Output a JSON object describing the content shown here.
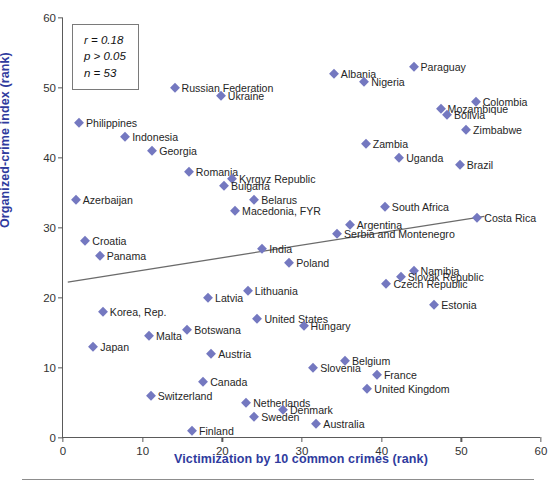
{
  "chart_data": {
    "type": "scatter",
    "title": "",
    "xlabel": "Victimization by 10 common crimes (rank)",
    "ylabel": "Organized-crime index (rank)",
    "xlim": [
      0,
      60
    ],
    "ylim": [
      0,
      60
    ],
    "xticks": [
      0,
      10,
      20,
      30,
      40,
      50,
      60
    ],
    "yticks": [
      0,
      10,
      20,
      30,
      40,
      50,
      60
    ],
    "grid": false,
    "legend": "none",
    "marker_color": "#7478c0",
    "marker_shape": "diamond",
    "annotations": {
      "r": "r = 0.18",
      "p": "p > 0.05",
      "n": "n = 53"
    },
    "trendline": {
      "type": "linear",
      "x0": 0.6,
      "y0": 22.2,
      "x1": 53.0,
      "y1": 31.6
    },
    "points": [
      {
        "label": "Paraguay",
        "x": 44.0,
        "y": 53.0,
        "side": "right"
      },
      {
        "label": "Albania",
        "x": 34.0,
        "y": 52.0,
        "side": "right"
      },
      {
        "label": "Nigeria",
        "x": 37.8,
        "y": 50.8,
        "side": "right"
      },
      {
        "label": "Russian Federation",
        "x": 14.0,
        "y": 50.0,
        "side": "right"
      },
      {
        "label": "Ukraine",
        "x": 19.8,
        "y": 48.8,
        "side": "right"
      },
      {
        "label": "Colombia",
        "x": 51.8,
        "y": 48.0,
        "side": "right"
      },
      {
        "label": "Mozambique",
        "x": 47.4,
        "y": 47.0,
        "side": "right"
      },
      {
        "label": "Bolivia",
        "x": 48.2,
        "y": 46.2,
        "side": "right"
      },
      {
        "label": "Philippines",
        "x": 2.0,
        "y": 45.0,
        "side": "right"
      },
      {
        "label": "Zimbabwe",
        "x": 50.6,
        "y": 44.0,
        "side": "right"
      },
      {
        "label": "Indonesia",
        "x": 7.8,
        "y": 43.0,
        "side": "right"
      },
      {
        "label": "Zambia",
        "x": 38.0,
        "y": 42.0,
        "side": "right"
      },
      {
        "label": "Georgia",
        "x": 11.2,
        "y": 41.0,
        "side": "right"
      },
      {
        "label": "Uganda",
        "x": 42.2,
        "y": 40.0,
        "side": "right"
      },
      {
        "label": "Brazil",
        "x": 49.8,
        "y": 39.0,
        "side": "right"
      },
      {
        "label": "Romania",
        "x": 15.8,
        "y": 38.0,
        "side": "right"
      },
      {
        "label": "Kyrgyz Republic",
        "x": 21.2,
        "y": 37.0,
        "side": "right"
      },
      {
        "label": "Bulgaria",
        "x": 20.2,
        "y": 36.0,
        "side": "right"
      },
      {
        "label": "Azerbaijan",
        "x": 1.6,
        "y": 34.0,
        "side": "right"
      },
      {
        "label": "Belarus",
        "x": 24.0,
        "y": 34.0,
        "side": "right"
      },
      {
        "label": "South Africa",
        "x": 40.4,
        "y": 33.0,
        "side": "right"
      },
      {
        "label": "Macedonia, FYR",
        "x": 21.6,
        "y": 32.4,
        "side": "right"
      },
      {
        "label": "Argentina",
        "x": 36.0,
        "y": 30.4,
        "side": "right"
      },
      {
        "label": "Costa Rica",
        "x": 52.0,
        "y": 31.4,
        "side": "right"
      },
      {
        "label": "Croatia",
        "x": 2.8,
        "y": 28.2,
        "side": "right"
      },
      {
        "label": "Serbia and Montenegro",
        "x": 34.4,
        "y": 29.2,
        "side": "right"
      },
      {
        "label": "Panama",
        "x": 4.6,
        "y": 26.0,
        "side": "right"
      },
      {
        "label": "India",
        "x": 25.0,
        "y": 27.0,
        "side": "right"
      },
      {
        "label": "Poland",
        "x": 28.4,
        "y": 25.0,
        "side": "right"
      },
      {
        "label": "Namibia",
        "x": 44.0,
        "y": 23.8,
        "side": "right"
      },
      {
        "label": "Slovak Republic",
        "x": 42.4,
        "y": 23.0,
        "side": "right"
      },
      {
        "label": "Czech Republic",
        "x": 40.6,
        "y": 22.0,
        "side": "right"
      },
      {
        "label": "Lithuania",
        "x": 23.2,
        "y": 21.0,
        "side": "right"
      },
      {
        "label": "Latvia",
        "x": 18.2,
        "y": 20.0,
        "side": "right"
      },
      {
        "label": "Estonia",
        "x": 46.6,
        "y": 19.0,
        "side": "right"
      },
      {
        "label": "Korea, Rep.",
        "x": 5.0,
        "y": 18.0,
        "side": "right"
      },
      {
        "label": "United States",
        "x": 24.4,
        "y": 17.0,
        "side": "right"
      },
      {
        "label": "Hungary",
        "x": 30.2,
        "y": 16.0,
        "side": "right"
      },
      {
        "label": "Botswana",
        "x": 15.6,
        "y": 15.4,
        "side": "right"
      },
      {
        "label": "Malta",
        "x": 10.8,
        "y": 14.6,
        "side": "right"
      },
      {
        "label": "Japan",
        "x": 3.8,
        "y": 13.0,
        "side": "right"
      },
      {
        "label": "Austria",
        "x": 18.6,
        "y": 12.0,
        "side": "right"
      },
      {
        "label": "Belgium",
        "x": 35.4,
        "y": 11.0,
        "side": "right"
      },
      {
        "label": "Slovenia",
        "x": 31.4,
        "y": 10.0,
        "side": "right"
      },
      {
        "label": "France",
        "x": 39.4,
        "y": 9.0,
        "side": "right"
      },
      {
        "label": "Canada",
        "x": 17.6,
        "y": 8.0,
        "side": "right"
      },
      {
        "label": "United Kingdom",
        "x": 38.2,
        "y": 7.0,
        "side": "right"
      },
      {
        "label": "Switzerland",
        "x": 11.0,
        "y": 6.0,
        "side": "right"
      },
      {
        "label": "Netherlands",
        "x": 23.0,
        "y": 5.0,
        "side": "right"
      },
      {
        "label": "Denmark",
        "x": 27.6,
        "y": 4.0,
        "side": "right"
      },
      {
        "label": "Sweden",
        "x": 24.0,
        "y": 3.0,
        "side": "right"
      },
      {
        "label": "Australia",
        "x": 31.8,
        "y": 2.0,
        "side": "right"
      },
      {
        "label": "Finland",
        "x": 16.2,
        "y": 1.0,
        "side": "right"
      }
    ]
  },
  "caption": ""
}
